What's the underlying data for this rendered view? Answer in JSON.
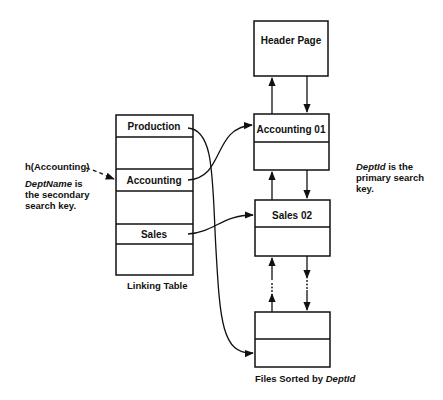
{
  "diagram": {
    "header_page": {
      "label": "Header Page"
    },
    "file_pages": [
      {
        "label": "Accounting 01"
      },
      {
        "label": "Sales 02"
      },
      {
        "label": ""
      }
    ],
    "linking_table": {
      "caption": "Linking Table",
      "rows": [
        "Production",
        "",
        "Accounting",
        "",
        "Sales",
        ""
      ]
    },
    "hash_call": {
      "label": "h(Accounting)"
    },
    "secondary_key_note": {
      "italic": "DeptName",
      "rest_line1": " is",
      "line2": "the secondary",
      "line3": "search key."
    },
    "primary_key_note": {
      "italic": "DeptId",
      "rest_line1": " is the",
      "line2": "primary search",
      "line3": "key."
    },
    "files_caption": {
      "prefix": "Files Sorted by ",
      "italic": "DeptId"
    },
    "continuation_marker": "⋮"
  },
  "colors": {
    "line": "#111111",
    "background": "#ffffff"
  }
}
